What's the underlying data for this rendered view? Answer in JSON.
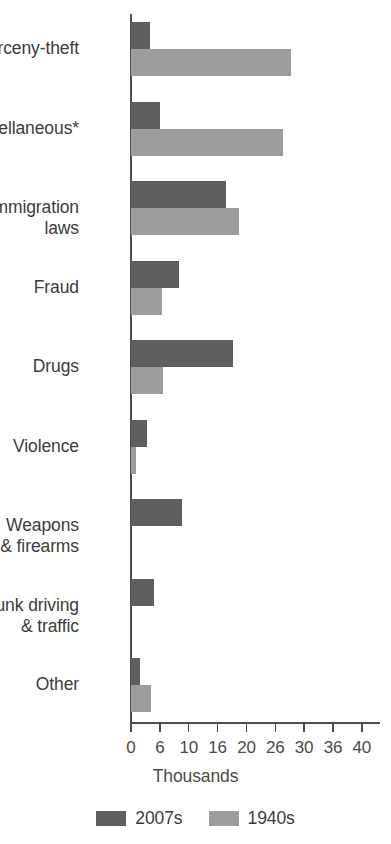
{
  "chart_data": {
    "type": "bar",
    "orientation": "horizontal",
    "title": "",
    "xlabel": "Thousands",
    "ylabel": "",
    "xlim": [
      0,
      40
    ],
    "grid": false,
    "legend_position": "bottom",
    "tick_labels": [
      "0",
      "6",
      "10",
      "16",
      "20",
      "26",
      "30",
      "36",
      "40"
    ],
    "tick_values": [
      0,
      5,
      10,
      15,
      20,
      25,
      30,
      35,
      40
    ],
    "categories": [
      "Larceny-theft",
      "Miscellaneous*",
      "Immigration\nlaws",
      "Fraud",
      "Drugs",
      "Violence",
      "Weapons\n& firearms",
      "Drunk driving\n& traffic",
      "Other"
    ],
    "series": [
      {
        "name": "2007s",
        "color": "#5e5e5e",
        "values": [
          3.3,
          5.0,
          16.4,
          8.3,
          17.6,
          2.8,
          8.8,
          4.0,
          1.6
        ]
      },
      {
        "name": "1940s",
        "color": "#9d9d9d",
        "values": [
          27.8,
          26.3,
          18.7,
          5.4,
          5.5,
          0.9,
          0,
          0,
          3.5
        ]
      }
    ]
  },
  "axis": {
    "title": "Thousands"
  },
  "legend": {
    "items": [
      {
        "label": "2007s",
        "color": "#5e5e5e"
      },
      {
        "label": "1940s",
        "color": "#9d9d9d"
      }
    ]
  }
}
